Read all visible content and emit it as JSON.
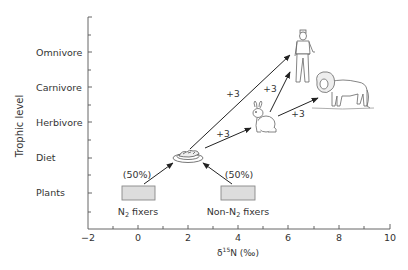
{
  "diagram": {
    "y_axis_label": "Trophic level",
    "x_axis_label_prefix": "δ",
    "x_axis_label_sup": "15",
    "x_axis_label_suffix": "N (‰)",
    "y_categories": [
      "Plants",
      "Diet",
      "Herbivore",
      "Carnivore",
      "Omnivore"
    ],
    "x_ticks": [
      "−2",
      "0",
      "2",
      "4",
      "6",
      "8",
      "10"
    ],
    "sources": [
      {
        "label_main": "N",
        "label_sub": "2",
        "label_rest": " fixers",
        "percent": "(50%)"
      },
      {
        "label_main": "Non-N",
        "label_sub": "2",
        "label_rest": " fixers",
        "percent": "(50%)"
      }
    ],
    "enrichment_labels": [
      "+3",
      "+3",
      "+3",
      "+3"
    ],
    "nodes": [
      {
        "id": "diet",
        "icon": "food-plate-icon"
      },
      {
        "id": "herbivore",
        "icon": "rabbit-icon"
      },
      {
        "id": "carnivore",
        "icon": "lion-icon"
      },
      {
        "id": "omnivore",
        "icon": "human-icon"
      }
    ],
    "colors": {
      "axis": "#555555",
      "text": "#333333",
      "arrow": "#222222",
      "box_fill": "#dddddd",
      "box_stroke": "#888888",
      "sketch": "#666666"
    }
  }
}
